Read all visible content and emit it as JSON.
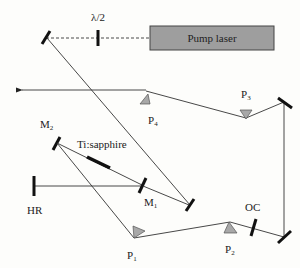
{
  "diagram": {
    "labels": {
      "half_wave_plate": "λ/2",
      "pump_laser": "Pump laser",
      "p1": "P",
      "p1_sub": "1",
      "p2": "P",
      "p2_sub": "2",
      "p3": "P",
      "p3_sub": "3",
      "p4": "P",
      "p4_sub": "4",
      "m1": "M",
      "m1_sub": "1",
      "m2": "M",
      "m2_sub": "2",
      "crystal": "Ti:sapphire",
      "hr": "HR",
      "oc": "OC"
    },
    "colors": {
      "pump_box": "#9e9e9e",
      "prism": "#a8a8a8",
      "beam": "#333333",
      "mirror": "#111111"
    }
  }
}
